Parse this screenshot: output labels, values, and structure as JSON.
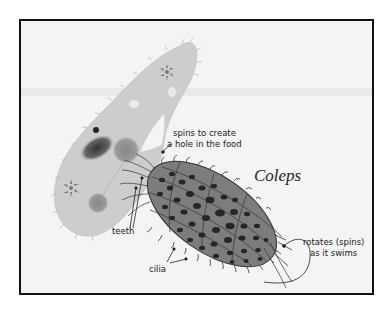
{
  "diagram": {
    "title": "Coleps",
    "labels": {
      "spins_line1": "spins to create",
      "spins_line2": "a hole in the food",
      "teeth": "teeth",
      "cilia": "cilia",
      "rotates_line1": "rotates (spins)",
      "rotates_line2": "as it swims"
    },
    "organisms": [
      {
        "name": "prey-organism",
        "description": "large slipper-shaped ciliate (paramecium-like) being eaten"
      },
      {
        "name": "coleps",
        "description": "barrel-shaped ciliate with plated armor, teeth and cilia"
      }
    ],
    "colors": {
      "background": "#f4f4f4",
      "frame": "#111111",
      "prey_body": "#cfcfcf",
      "coleps_body": "#7a7a7a",
      "coleps_pores": "#2a2a2a",
      "text": "#222222"
    }
  }
}
